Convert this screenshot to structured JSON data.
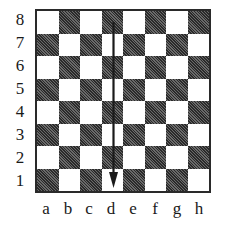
{
  "diagram": {
    "type": "chessboard",
    "ranks": [
      "8",
      "7",
      "6",
      "5",
      "4",
      "3",
      "2",
      "1"
    ],
    "files": [
      "a",
      "b",
      "c",
      "d",
      "e",
      "f",
      "g",
      "h"
    ],
    "colors": {
      "dark_square": "#3a3a3a",
      "light_square": "#ffffff",
      "border": "#2a2a2a",
      "arrow": "#1a1a1a"
    },
    "arrow": {
      "icon": "arrow-down-icon",
      "from": "d8",
      "to": "d1",
      "file": "d"
    }
  }
}
